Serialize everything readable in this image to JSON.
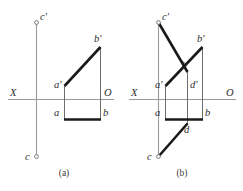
{
  "figure": {
    "colors": {
      "axis": "#9a9a9a",
      "thick_edge": "#1a1a1a",
      "thin_edge": "#5d5d5d",
      "background": "#ffffff",
      "label_text": "#2b2b2b"
    },
    "captions": [
      {
        "id": "a",
        "text": "(a)"
      },
      {
        "id": "b",
        "text": "(b)"
      }
    ]
  },
  "panel_a": {
    "caption": "(a)",
    "axis_labels": {
      "x_axis": "X",
      "origin": "O"
    },
    "point_labels": {
      "c_prime": "c'",
      "a_prime": "a'",
      "b_prime": "b'",
      "a": "a",
      "b": "b",
      "c": "c"
    }
  },
  "panel_b": {
    "caption": "(b)",
    "axis_labels": {
      "x_axis": "X",
      "origin": "O"
    },
    "point_labels": {
      "c_prime": "c'",
      "a_prime": "a'",
      "d_prime": "d'",
      "b_prime": "b'",
      "a": "a",
      "d": "d",
      "b": "b",
      "c": "c"
    }
  }
}
